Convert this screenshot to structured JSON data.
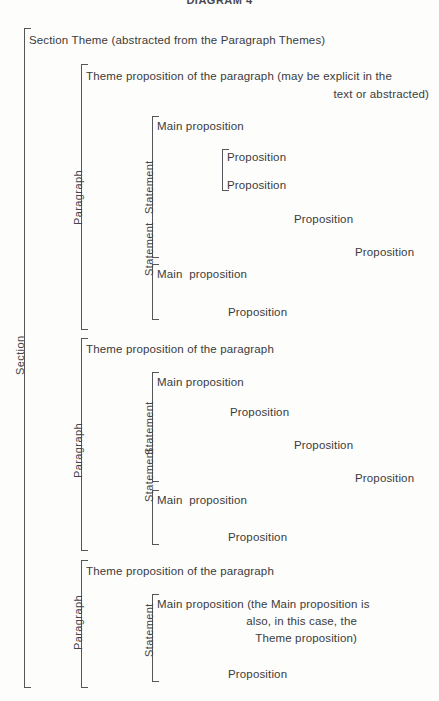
{
  "title": "DIAGRAM 4",
  "labels": {
    "section": "Section",
    "paragraph": "Paragraph",
    "statement": "Statement"
  },
  "section": {
    "theme": "Section Theme (abstracted from the Paragraph Themes)"
  },
  "paragraphs": [
    {
      "theme_line1": "Theme proposition of the paragraph (may be explicit in the",
      "theme_line2": "text or abstracted)",
      "statements": [
        {
          "main": "Main proposition",
          "inner_group": [
            "Proposition",
            "Proposition"
          ],
          "cascade": [
            "Proposition",
            "Proposition"
          ]
        },
        {
          "main": "Main  proposition",
          "cascade": [
            "Proposition"
          ]
        }
      ]
    },
    {
      "theme_line1": "Theme proposition of the paragraph",
      "statements": [
        {
          "main": "Main proposition",
          "cascade": [
            "Proposition",
            "Proposition",
            "Proposition"
          ]
        },
        {
          "main": "Main  proposition",
          "cascade": [
            "Proposition"
          ]
        }
      ]
    },
    {
      "theme_line1": "Theme proposition of the paragraph",
      "statements": [
        {
          "main": "Main proposition (the Main proposition is",
          "main_line2": "also, in this case, the",
          "main_line3": "Theme proposition)",
          "cascade": [
            "Proposition"
          ]
        }
      ]
    }
  ],
  "colors": {
    "ink": "#3b3b3b",
    "rule": "#55555a",
    "background": "#fdfdfc"
  }
}
